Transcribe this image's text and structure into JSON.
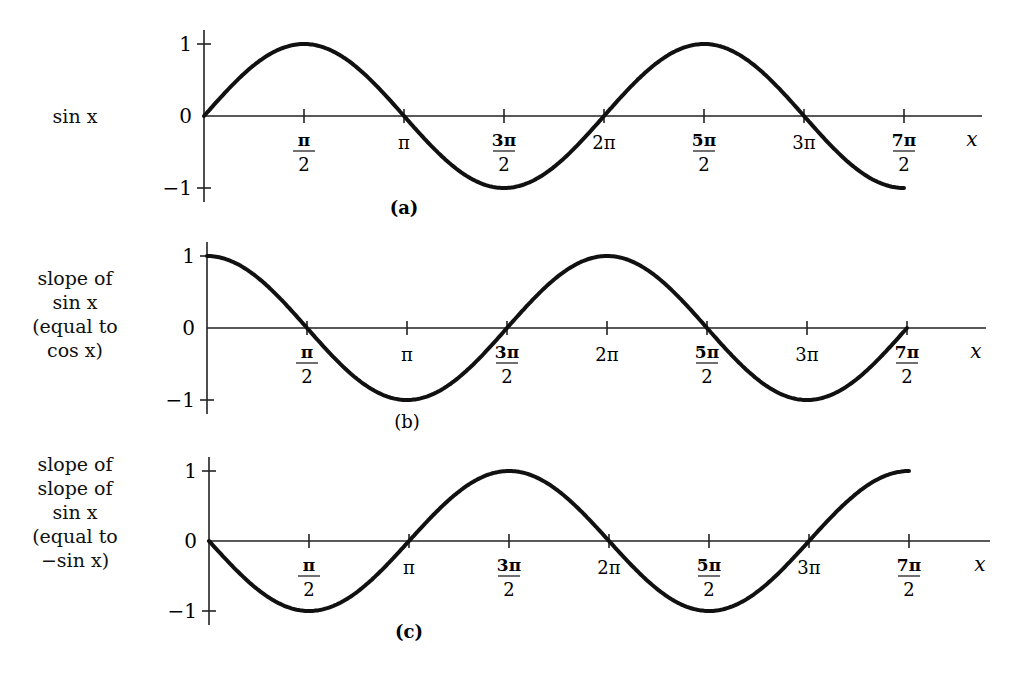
{
  "chart_data": [
    {
      "type": "line",
      "id": "a",
      "caption": "(a)",
      "ylabel": "sin x",
      "xlabel": "x",
      "function": "sin",
      "xlim": [
        0,
        "7π/2"
      ],
      "ylim": [
        -1,
        1
      ],
      "yticks": [
        "1",
        "0",
        "−1"
      ],
      "xticks": [
        "π/2",
        "π",
        "3π/2",
        "2π",
        "5π/2",
        "3π",
        "7π/2"
      ],
      "x": [
        0,
        1.5708,
        3.1416,
        4.7124,
        6.2832,
        7.854,
        9.4248,
        10.9956
      ],
      "y": [
        0,
        1,
        0,
        -1,
        0,
        1,
        0,
        -1
      ]
    },
    {
      "type": "line",
      "id": "b",
      "caption": "(b)",
      "ylabel": "slope of sin x (equal to cos x)",
      "xlabel": "x",
      "function": "cos",
      "xlim": [
        0,
        "7π/2"
      ],
      "ylim": [
        -1,
        1
      ],
      "yticks": [
        "1",
        "0",
        "−1"
      ],
      "xticks": [
        "π/2",
        "π",
        "3π/2",
        "2π",
        "5π/2",
        "3π",
        "7π/2"
      ],
      "x": [
        0,
        1.5708,
        3.1416,
        4.7124,
        6.2832,
        7.854,
        9.4248,
        10.9956
      ],
      "y": [
        1,
        0,
        -1,
        0,
        1,
        0,
        -1,
        0
      ]
    },
    {
      "type": "line",
      "id": "c",
      "caption": "(c)",
      "ylabel": "slope of slope of sin x (equal to −sin x)",
      "xlabel": "x",
      "function": "-sin",
      "xlim": [
        0,
        "7π/2"
      ],
      "ylim": [
        -1,
        1
      ],
      "yticks": [
        "1",
        "0",
        "−1"
      ],
      "xticks": [
        "π/2",
        "π",
        "3π/2",
        "2π",
        "5π/2",
        "3π",
        "7π/2"
      ],
      "x": [
        0,
        1.5708,
        3.1416,
        4.7124,
        6.2832,
        7.854,
        9.4248,
        10.9956
      ],
      "y": [
        0,
        -1,
        0,
        1,
        0,
        -1,
        0,
        1
      ]
    }
  ],
  "panels": [
    {
      "side_lines": [
        "sin x"
      ],
      "caption": "(a)",
      "x_label": "x",
      "y_ticks": [
        "1",
        "0",
        "−1"
      ]
    },
    {
      "side_lines": [
        "slope of",
        "sin x",
        "(equal to",
        "cos x)"
      ],
      "caption": "(b)",
      "x_label": "x",
      "y_ticks": [
        "1",
        "0",
        "−1"
      ]
    },
    {
      "side_lines": [
        "slope of",
        "slope of",
        "sin x",
        "(equal to",
        "−sin x)"
      ],
      "caption": "(c)",
      "x_label": "x",
      "y_ticks": [
        "1",
        "0",
        "−1"
      ]
    }
  ],
  "x_tick_labels": [
    {
      "num": "π",
      "den": "2",
      "frac": true
    },
    {
      "num": "π",
      "frac": false
    },
    {
      "num": "3π",
      "den": "2",
      "frac": true
    },
    {
      "num": "2π",
      "frac": false
    },
    {
      "num": "5π",
      "den": "2",
      "frac": true
    },
    {
      "num": "3π",
      "frac": false
    },
    {
      "num": "7π",
      "den": "2",
      "frac": true
    }
  ]
}
